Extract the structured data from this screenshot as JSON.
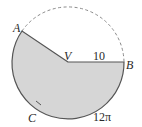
{
  "diagram": {
    "type": "circle-sector",
    "points": {
      "A": "A",
      "B": "B",
      "C": "C",
      "V": "V"
    },
    "labels": {
      "radius": "10",
      "arc_length": "12π"
    },
    "colors": {
      "sector_fill": "#d6d6d6",
      "stroke": "#555555",
      "dashed_arc": "#8a8a8a"
    }
  }
}
